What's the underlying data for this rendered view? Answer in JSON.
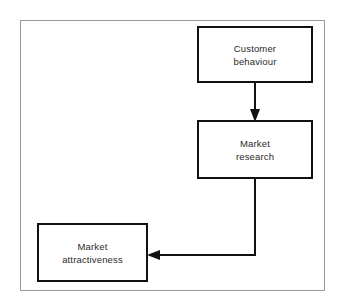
{
  "diagram": {
    "type": "flowchart",
    "title": "",
    "background_color": "#ffffff",
    "frame": {
      "border_color": "#9a9a9a",
      "border_width": 1
    },
    "node_style": {
      "shape": "rectangle",
      "fill": "#ffffff",
      "stroke": "#111111",
      "stroke_width": 2,
      "text_color": "#2b2b2b"
    },
    "connector_style": {
      "stroke": "#111111",
      "stroke_width": 2,
      "arrowhead": "solid-triangle"
    },
    "nodes": [
      {
        "id": "customer-behaviour",
        "line1": "Customer",
        "line2": "behaviour"
      },
      {
        "id": "market-research",
        "line1": "Market",
        "line2": "research"
      },
      {
        "id": "market-attractiveness",
        "line1": "Market",
        "line2": "attractiveness"
      }
    ],
    "edges": [
      {
        "id": "edge-customer-behaviour-to-market-research",
        "from": "customer-behaviour",
        "to": "market-research",
        "label": "",
        "direction": "down"
      },
      {
        "id": "edge-market-research-to-market-attractiveness",
        "from": "market-research",
        "to": "market-attractiveness",
        "label": "",
        "direction": "left"
      }
    ]
  }
}
